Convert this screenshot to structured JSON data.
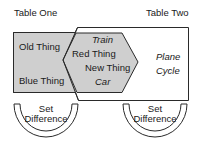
{
  "diagram": {
    "table_one": {
      "title": "Table One",
      "items": [
        "Old Thing",
        "Blue Thing"
      ]
    },
    "table_two": {
      "title": "Table Two",
      "items": [
        "Plane",
        "Cycle"
      ]
    },
    "intersection": {
      "items": [
        "Train",
        "Red Thing",
        "New Thing",
        "Car"
      ]
    },
    "left_operation": {
      "line1": "Set",
      "line2": "Difference"
    },
    "right_operation": {
      "line1": "Set",
      "line2": "Difference"
    },
    "colors": {
      "shaded": "#cfcfcf",
      "stroke": "#2a2a2a",
      "background": "#ffffff"
    }
  }
}
